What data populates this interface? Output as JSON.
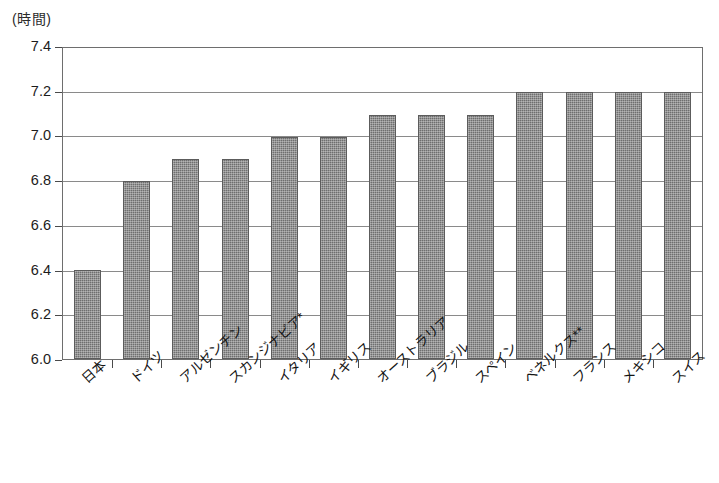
{
  "chart_data": {
    "type": "bar",
    "title": "",
    "subtitle": "",
    "xlabel": "",
    "ylabel": "",
    "unit_label": "(時間)",
    "ylim": [
      6.0,
      7.4
    ],
    "ytick_step": 0.2,
    "grid": true,
    "legend": false,
    "categories": [
      "日本",
      "ドイツ",
      "アルゼンチン",
      "スカンジナビア*",
      "イタリア",
      "イギリス",
      "オーストラリア",
      "ブラジル",
      "スペイン",
      "ベネルクス**",
      "フランス",
      "メキシコ",
      "スイス"
    ],
    "values": [
      6.4,
      6.8,
      6.9,
      6.9,
      7.0,
      7.0,
      7.1,
      7.1,
      7.1,
      7.2,
      7.2,
      7.2,
      7.2
    ],
    "ytick_labels": [
      "7.4",
      "7.2",
      "7.0",
      "6.8",
      "6.6",
      "6.4",
      "6.2",
      "6.0"
    ],
    "ytick_values": [
      7.4,
      7.2,
      7.0,
      6.8,
      6.6,
      6.4,
      6.2,
      6.0
    ],
    "bar_color": "#6f6f6f",
    "bar_edge_color": "#5c5c5c",
    "grid_color": "#8a8a8a",
    "axis_color": "#6e6e6e",
    "background_color": "#ffffff"
  }
}
